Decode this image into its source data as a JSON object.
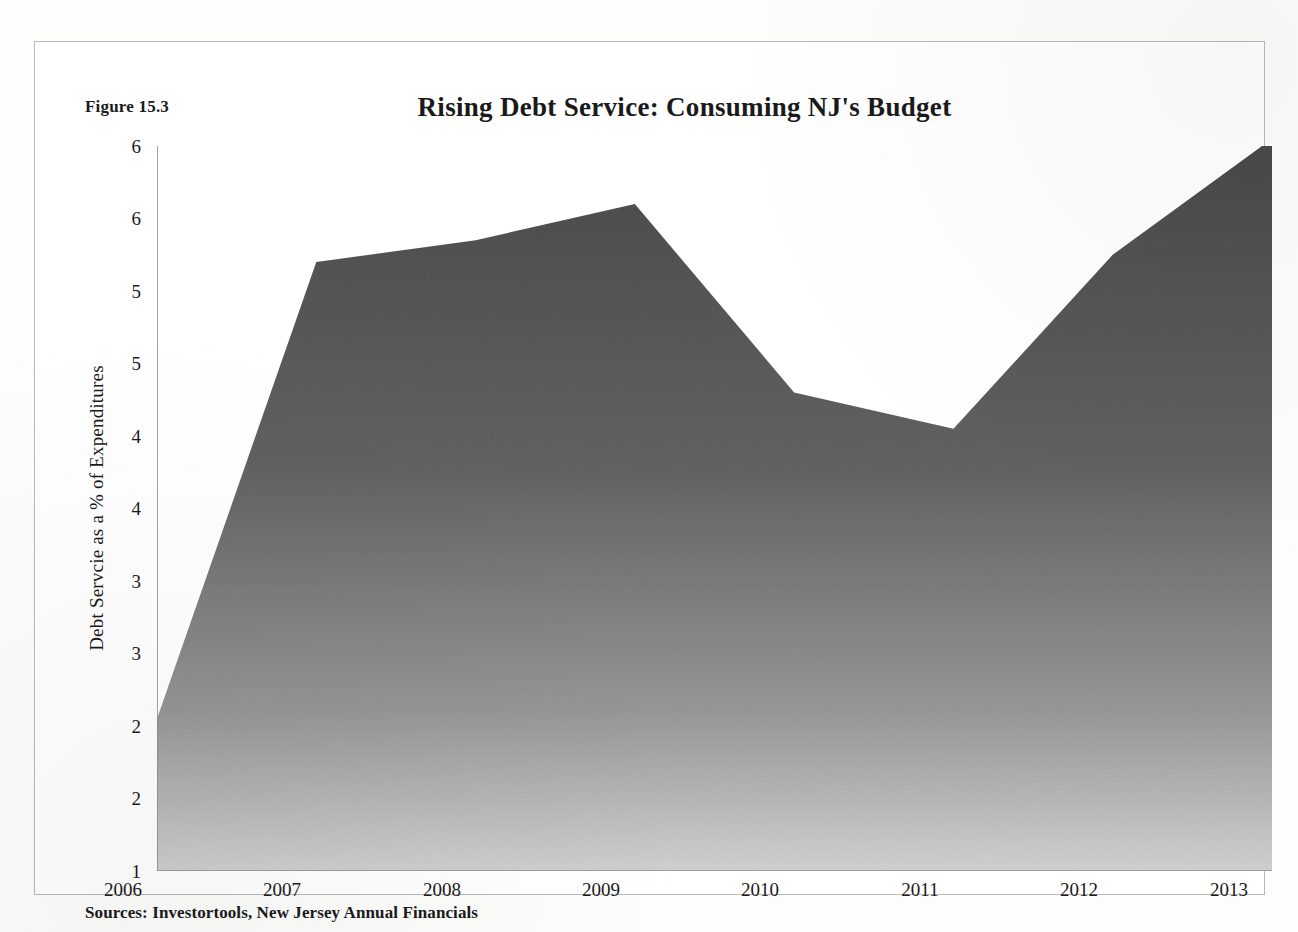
{
  "figure": {
    "number_label": "Figure 15.3",
    "source_note": "Sources: Investortools, New Jersey Annual Financials"
  },
  "chart_data": {
    "type": "area",
    "title": "Rising Debt Service: Consuming NJ's Budget",
    "xlabel": "",
    "ylabel": "Debt Servcie as a % of Expenditures",
    "categories": [
      "2006",
      "2007",
      "2008",
      "2009",
      "2010",
      "2011",
      "2012",
      "2013"
    ],
    "x": [
      2006,
      2007,
      2008,
      2009,
      2010,
      2011,
      2012,
      2013
    ],
    "values": [
      2.05,
      5.2,
      5.35,
      5.6,
      4.3,
      4.05,
      5.25,
      6.05
    ],
    "series": [
      {
        "name": "Debt Service as a % of Expenditures",
        "values": [
          2.05,
          5.2,
          5.35,
          5.6,
          4.3,
          4.05,
          5.25,
          6.05
        ]
      }
    ],
    "ylim": [
      1,
      6
    ],
    "xlim": [
      2006,
      2013
    ],
    "y_ticks": [
      1,
      1.5,
      2,
      2.5,
      3,
      3.5,
      4,
      4.5,
      5,
      5.5,
      6
    ],
    "y_tick_labels": [
      "1",
      "2",
      "2",
      "3",
      "3",
      "4",
      "4",
      "5",
      "5",
      "6",
      "6"
    ],
    "x_tick_labels": [
      "2006",
      "2007",
      "2008",
      "2009",
      "2010",
      "2011",
      "2012",
      "2013"
    ],
    "grid": false,
    "legend": "none",
    "colors": {
      "area_fill_top": "#4d4d4d",
      "area_fill_bottom": "#c9c9c9",
      "axis": "#8c8c8c",
      "text": "#1a1a1a",
      "frame": "#b9b9b9",
      "background": "#ffffff"
    }
  }
}
